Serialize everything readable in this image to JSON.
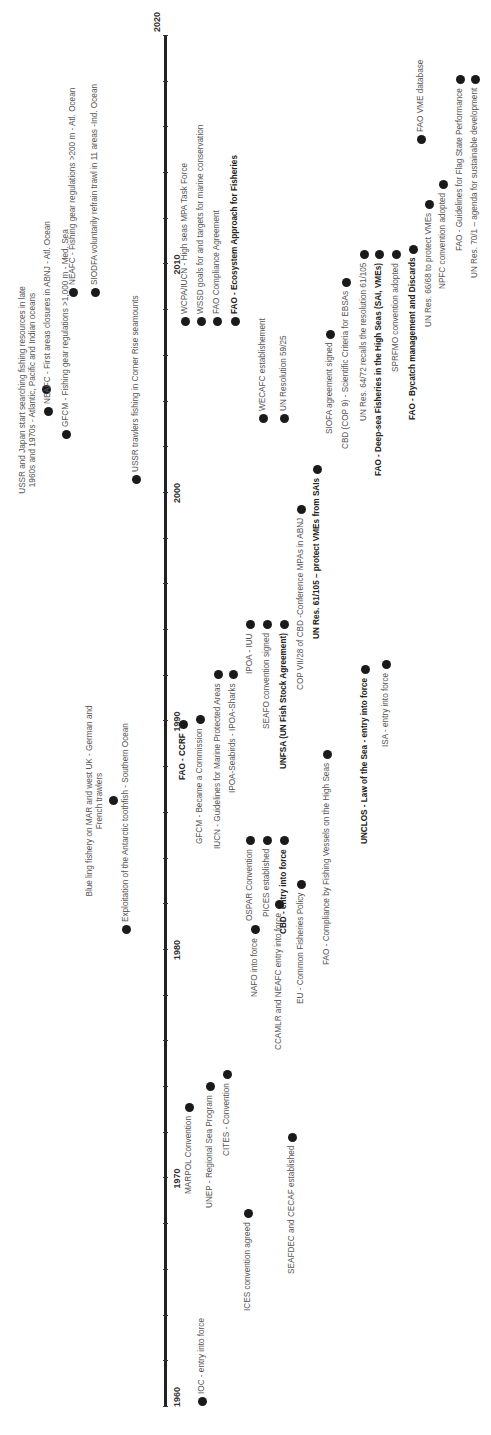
{
  "axis": {
    "start_year": 1960,
    "end_year": 2020,
    "tick_labels": [
      "1960",
      "1970",
      "1980",
      "1990",
      "2000",
      "2010",
      "2020"
    ]
  },
  "above": [
    {
      "id": "ussr-japan",
      "text": "USSR and Japan start searching fishing resources in late 1960s and 1970s - Atlantic, Pacific and Indian oceans",
      "x": 1092,
      "dotx": 1045,
      "y": 8,
      "w": 215,
      "dot_y": 46,
      "bold": false,
      "multi": true
    },
    {
      "id": "ussr-corner",
      "text": "USSR trawlers fishing in Corner Rise seamounts",
      "x": 1008,
      "y": 125,
      "dot_x": 955,
      "dot_y": 136,
      "bold": false
    },
    {
      "id": "blue-ling",
      "text": "Blue ling fishery on MAR and west UK - German and French trawlers",
      "x": 787,
      "y": 86,
      "w": 200,
      "dot_x": 634,
      "dot_y": 113,
      "bold": false,
      "multi": true
    },
    {
      "id": "toothfish",
      "text": "Exploitation of the Antarctic toothfish - Southern Ocean",
      "x": 527,
      "y": 124,
      "dot_x": 505,
      "dot_y": 126,
      "bold": false
    },
    {
      "id": "neafc-closures",
      "text": "NEAFC - First areas closures in ABNJ - Atl. Ocean",
      "x": 1023,
      "y": 43,
      "dot_x": 1023,
      "dot_y": 48,
      "bold": false
    },
    {
      "id": "gfcm-gear",
      "text": "GFCM - Fishing gear regulations >1,000 m - Med. Sea",
      "x": 1000,
      "y": 63,
      "dot_x": 1000,
      "dot_y": 66,
      "bold": false
    },
    {
      "id": "neafc-gear",
      "text": "NEAFC - Fishing gear regulations >200 m - Atl. Ocean",
      "x": 1149,
      "y": 70,
      "dot_x": 1142,
      "dot_y": 73,
      "bold": false
    },
    {
      "id": "siodfa",
      "text": "SIODFA voluntarily refrain trawl in 11 areas -Ind. Ocean",
      "x": 1149,
      "y": 92,
      "dot_x": 1142,
      "dot_y": 95,
      "bold": false
    }
  ],
  "below": [
    {
      "id": "ioc",
      "text": "IOC - entry into force",
      "dot_x": 33,
      "y": 201,
      "bold": false
    },
    {
      "id": "ices",
      "text": "ICES convention agreed",
      "x": 30,
      "y": 245,
      "dot_x": 221,
      "dot_y": 248,
      "bold": false,
      "rev": true
    },
    {
      "id": "seafdec",
      "text": "SEAFDEC and CECAF established",
      "x": 30,
      "y": 289,
      "dot_x": 297,
      "dot_y": 292,
      "bold": false,
      "rev": true
    },
    {
      "id": "marpol",
      "text": "MARPOL Convention",
      "x": 230,
      "dot_x": 327,
      "y": 188,
      "bold": false,
      "rev": true
    },
    {
      "id": "unep",
      "text": "UNEP - Regional Sea Program",
      "x": 230,
      "dot_x": 348,
      "y": 209,
      "bold": false,
      "rev": true
    },
    {
      "id": "cites",
      "text": "CITES - Convention",
      "x": 285,
      "dot_x": 360,
      "y": 226,
      "bold": false,
      "rev": true
    },
    {
      "id": "nafo",
      "text": "NAFO into force",
      "x": 510,
      "dot_x": 505,
      "y": 254,
      "bold": false,
      "rev": true
    },
    {
      "id": "ccamlr",
      "text": "CCAMLR and NEAFC entry into force",
      "x": 335,
      "dot_x": 530,
      "y": 278,
      "bold": false,
      "rev": true
    },
    {
      "id": "eu-cfp",
      "text": "EU - Common Fisheries Policy",
      "x": 335,
      "dot_x": 550,
      "y": 300,
      "bold": false,
      "rev": true
    },
    {
      "id": "fao-ccrf",
      "text": "FAO - CCRF",
      "x": 660,
      "dot_x": 710,
      "y": 182,
      "bold": true,
      "rev": true
    },
    {
      "id": "gfcm-comm",
      "text": "GFCM - Became a Commission",
      "x": 610,
      "dot_x": 715,
      "y": 199,
      "bold": false,
      "rev": true
    },
    {
      "id": "iucn",
      "text": "IUCN - Guidelines for Marine Protected Areas",
      "x": 618,
      "dot_x": 760,
      "y": 217,
      "bold": false,
      "rev": true
    },
    {
      "id": "ipoa-seabirds",
      "text": "IPOA-Seabirds - IPOA-Sharks",
      "x": 660,
      "dot_x": 760,
      "y": 232,
      "bold": false,
      "rev": true
    },
    {
      "id": "ospar",
      "text": "OSPAR Convention",
      "x": 590,
      "dot_x": 594,
      "y": 249,
      "bold": false,
      "rev": true
    },
    {
      "id": "pices",
      "text": "PICES established",
      "x": 600,
      "dot_x": 594,
      "y": 266,
      "bold": false,
      "rev": true
    },
    {
      "id": "cbd",
      "text": "CBD - entry into force",
      "x": 570,
      "dot_x": 594,
      "y": 283,
      "bold": true,
      "rev": true
    },
    {
      "id": "ipoa-iuu",
      "text": "IPOA - IUU",
      "x": 860,
      "dot_x": 810,
      "y": 249,
      "bold": false,
      "rev": true
    },
    {
      "id": "seafo",
      "text": "SEAFO convention signed",
      "x": 840,
      "dot_x": 810,
      "y": 266,
      "bold": false,
      "rev": true
    },
    {
      "id": "unfsa",
      "text": "UNFSA (UN Fish Stock Agreement)",
      "x": 820,
      "dot_x": 810,
      "y": 283,
      "bold": true,
      "rev": true
    },
    {
      "id": "cop7",
      "text": "COP VII/28 of CBD -Conference MPAs in ABNJ",
      "x": 730,
      "dot_x": 925,
      "y": 300,
      "bold": false,
      "rev": true
    },
    {
      "id": "unres-61",
      "text": "UN Res. 61/105 – protect VMEs from SAIs",
      "x": 740,
      "dot_x": 965,
      "y": 316,
      "bold": true,
      "rev": true
    },
    {
      "id": "fao-compliance-hs",
      "text": "FAO - Compliance by Fishing Vessels on the High Seas",
      "x": 425,
      "dot_x": 680,
      "y": 326,
      "bold": false,
      "rev": true
    },
    {
      "id": "unclos",
      "text": "UNCLOS - Law of the Sea - entry into force",
      "x": 570,
      "dot_x": 765,
      "y": 364,
      "bold": true,
      "rev": true
    },
    {
      "id": "isa",
      "text": "ISA - entry into force",
      "x": 630,
      "dot_x": 770,
      "y": 385,
      "bold": false,
      "rev": true
    },
    {
      "id": "wcpa",
      "text": "WCPA/IUCN - High seas MPA Task Force",
      "x": 1120,
      "dot_x": 1113,
      "y": 184,
      "bold": false
    },
    {
      "id": "wssd",
      "text": "WSSD goals for and targets for marine conservation",
      "x": 1120,
      "dot_x": 1113,
      "y": 200,
      "bold": false
    },
    {
      "id": "fao-compliance",
      "text": "FAO Compliance Agreement",
      "x": 1120,
      "dot_x": 1113,
      "y": 216,
      "bold": false
    },
    {
      "id": "fao-eaf",
      "text": "FAO - Ecosystem Approach for Fisheries",
      "x": 1120,
      "dot_x": 1113,
      "y": 234,
      "bold": true
    },
    {
      "id": "wecafc",
      "text": "WECAFC establishement",
      "x": 1024,
      "dot_x": 1016,
      "y": 262,
      "bold": false
    },
    {
      "id": "un-res-59",
      "text": "UN Resolution 59/25",
      "x": 1024,
      "dot_x": 1016,
      "y": 283,
      "bold": false
    },
    {
      "id": "siofa",
      "text": "SIOFA agreement signed",
      "x": 1005,
      "dot_x": 1100,
      "y": 329,
      "bold": false,
      "rev": true
    },
    {
      "id": "cbd-cop9",
      "text": "CBD (COP 9) - Scientific Criteria for EBSAs",
      "x": 975,
      "dot_x": 1152,
      "y": 345,
      "bold": false,
      "rev": true
    },
    {
      "id": "unres-64",
      "text": "UN Res. 64/72 recalls  the resolution 61/105",
      "x": 1010,
      "dot_x": 1180,
      "y": 363,
      "bold": false,
      "rev": true
    },
    {
      "id": "fao-deepsea",
      "text": "FAO - Deep-sea Fisheries in the High Seas (SAI, VMEs)",
      "x": 970,
      "dot_x": 1180,
      "y": 378,
      "bold": true,
      "rev": true
    },
    {
      "id": "sprfmo",
      "text": "SPRFMO convention adopted",
      "x": 1090,
      "dot_x": 1180,
      "y": 395,
      "bold": false,
      "rev": true
    },
    {
      "id": "fao-bycatch",
      "text": "FAO - Bycatch management and Discards",
      "x": 1035,
      "dot_x": 1185,
      "y": 412,
      "bold": true,
      "rev": true
    },
    {
      "id": "unres-66",
      "text": "UN Res. 66/68 to protect VMEs",
      "x": 1105,
      "dot_x": 1230,
      "y": 428,
      "bold": false,
      "rev": true
    },
    {
      "id": "npfc",
      "text": "NPFC convention adopted",
      "x": 1140,
      "dot_x": 1250,
      "y": 442,
      "bold": false,
      "rev": true
    },
    {
      "id": "fao-flag",
      "text": "FAO - Guidelines for Flag State Performance",
      "x": 1210,
      "dot_x": 1355,
      "y": 459,
      "bold": false,
      "rev": true
    },
    {
      "id": "unres-70",
      "text": "UN Res. 70/1 – agenda for sustainable development",
      "x": 1160,
      "dot_x": 1355,
      "y": 474,
      "bold": false,
      "rev": true
    },
    {
      "id": "fao-vme-db",
      "text": "FAO VME database",
      "x": 1303,
      "dot_x": 1295,
      "y": 420,
      "bold": false
    }
  ]
}
